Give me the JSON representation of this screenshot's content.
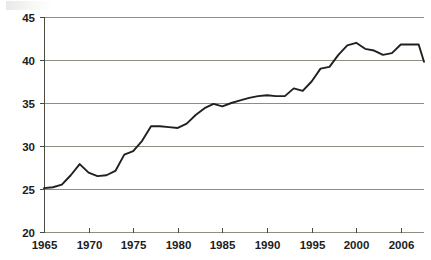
{
  "chart_data": {
    "type": "line",
    "title": "",
    "subtitle": "",
    "xlabel": "",
    "ylabel": "",
    "xlim": [
      1965,
      2007.5
    ],
    "ylim": [
      20,
      45
    ],
    "grid": true,
    "legend": null,
    "legend_position": "none",
    "y_ticks": [
      20,
      25,
      30,
      35,
      40,
      45
    ],
    "y_tick_labels": [
      "20",
      "25",
      "30",
      "35",
      "40",
      "45"
    ],
    "x_ticks": [
      1965,
      1970,
      1975,
      1980,
      1985,
      1990,
      1995,
      2000,
      2005
    ],
    "x_tick_labels": [
      "1965",
      "1970",
      "1975",
      "1980",
      "1985",
      "1990",
      "1995",
      "2000",
      "2006"
    ],
    "series": [
      {
        "name": "series-1",
        "color": "#231f1c",
        "x": [
          1965,
          1966,
          1967,
          1968,
          1969,
          1970,
          1971,
          1972,
          1973,
          1974,
          1975,
          1976,
          1977,
          1978,
          1979,
          1980,
          1981,
          1982,
          1983,
          1984,
          1985,
          1986,
          1987,
          1988,
          1989,
          1990,
          1991,
          1992,
          1993,
          1994,
          1995,
          1996,
          1997,
          1998,
          1999,
          2000,
          2001,
          2002,
          2003,
          2004,
          2005,
          2006,
          2007
        ],
        "values": [
          25.1,
          25.2,
          25.5,
          26.6,
          27.9,
          26.9,
          26.5,
          26.6,
          27.1,
          29.0,
          29.4,
          30.6,
          32.3,
          32.3,
          32.2,
          32.1,
          32.6,
          33.6,
          34.4,
          34.9,
          34.6,
          35.0,
          35.3,
          35.6,
          35.8,
          35.9,
          35.8,
          35.8,
          36.7,
          36.4,
          37.5,
          39.0,
          39.2,
          40.6,
          41.7,
          42.0,
          41.3,
          41.1,
          40.6,
          40.8,
          41.8,
          41.8,
          41.8
        ]
      }
    ],
    "colors": {
      "line": "#231f1c",
      "gridline": "#8d8d82",
      "axis": "#4a4a45",
      "background": "#ffffff",
      "text": "#1c1c1c"
    },
    "geometry": {
      "plot_left": 44,
      "plot_right": 424,
      "plot_top": 17,
      "plot_bottom": 232,
      "year_start": 1965,
      "year_end": 2007.6,
      "final_drop_value": 39.8
    }
  }
}
